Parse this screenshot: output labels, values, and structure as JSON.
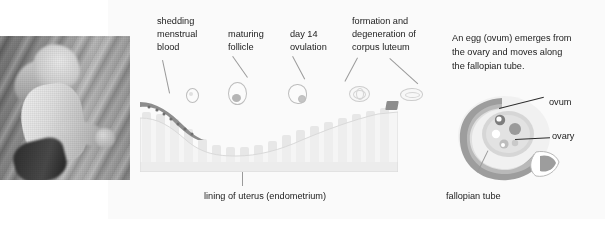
{
  "figure": {
    "photo": {
      "alt_name": "running-woman-photo",
      "description": "grayscale motion-blurred photograph of a woman running"
    },
    "cycle_labels": [
      {
        "id": "shedding-menstrual-blood",
        "text": "shedding\nmenstrual\nblood"
      },
      {
        "id": "maturing-follicle",
        "text": "maturing\nfollicle"
      },
      {
        "id": "day-14-ovulation",
        "text": "day 14\novulation"
      },
      {
        "id": "corpus-luteum",
        "text": "formation and\ndegeneration of\ncorpus luteum"
      }
    ],
    "caption": "lining of uterus (endometrium)",
    "side_note": "An egg (ovum) emerges from the ovary and moves along the fallopian tube.",
    "anatomy_labels": [
      {
        "id": "ovum",
        "text": "ovum"
      },
      {
        "id": "ovary",
        "text": "ovary"
      },
      {
        "id": "fallopian-tube",
        "text": "fallopian tube"
      }
    ],
    "colors": {
      "panel_background": "#fafafa",
      "page_background": "#ffffff",
      "text": "#1b1b1b",
      "leader_line": "#9a9a9a",
      "endometrium_fill": "#e7e7e7",
      "endometrium_base": "#e3e3e3",
      "shedding_layer": "#8d8d8d",
      "tube_fill": "#9d9d9d",
      "ovary_fill": "#d6d6d6"
    },
    "icons": {
      "follicle_small": "small-follicle-icon",
      "follicle_maturing": "maturing-follicle-icon",
      "follicle_ovulating": "ovulating-follicle-icon",
      "corpus_luteum_formed": "corpus-luteum-formed-icon",
      "corpus_luteum_degenerating": "corpus-luteum-degenerating-icon"
    }
  }
}
